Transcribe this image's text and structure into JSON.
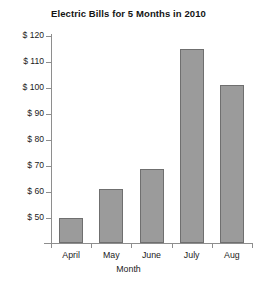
{
  "chart_data": {
    "type": "bar",
    "title": "Electric Bills for 5 Months in 2010",
    "xlabel": "Month",
    "ylabel": "",
    "categories": [
      "April",
      "May",
      "June",
      "July",
      "Aug"
    ],
    "values": [
      50,
      61,
      69,
      115,
      101
    ],
    "ytick_labels": [
      "$ 50",
      "$ 60",
      "$ 70",
      "$ 80",
      "$ 90",
      "$ 100",
      "$ 110",
      "$ 120"
    ],
    "ytick_values": [
      50,
      60,
      70,
      80,
      90,
      100,
      110,
      120
    ],
    "ylim": [
      40,
      120
    ],
    "grid": false,
    "legend": null,
    "bar_color": "#9b9b9b",
    "bar_border_color": "#6f6f6f",
    "axis_color": "#8e8e8e",
    "background": "#ffffff"
  }
}
